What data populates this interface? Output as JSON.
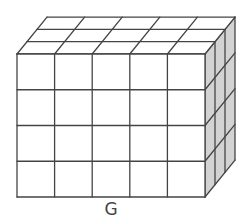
{
  "figure": {
    "label": "G",
    "shape": "rectangular prism of unit cubes",
    "cubes_wide": 5,
    "cubes_tall": 4,
    "cubes_deep": 3,
    "total_cubes": 60
  },
  "colors": {
    "front_face": "#ffffff",
    "top_face": "#ffffff",
    "side_face": "#d3d3d3",
    "edge": "#444444"
  }
}
